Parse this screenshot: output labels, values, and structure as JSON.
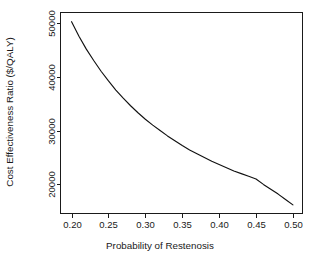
{
  "chart_data": {
    "type": "line",
    "title": "",
    "subtitle": "",
    "xlabel": "Probability of Restenosis",
    "ylabel": "Cost Effectiveness Ratio ($/QALY)",
    "xlim": [
      0.185,
      0.513
    ],
    "ylim": [
      14600,
      51900
    ],
    "grid": false,
    "legend": null,
    "annotations": [],
    "xticks": [
      0.2,
      0.25,
      0.3,
      0.35,
      0.4,
      0.45,
      0.5
    ],
    "xticklabels": [
      "0.20",
      "0.25",
      "0.30",
      "0.35",
      "0.40",
      "0.45",
      "0.50"
    ],
    "yticks": [
      20000,
      30000,
      40000,
      50000
    ],
    "yticklabels": [
      "20000",
      "30000",
      "40000",
      "50000"
    ],
    "series": [
      {
        "name": "Cost Effectiveness Ratio",
        "color": "#111111",
        "x": [
          0.2,
          0.21,
          0.22,
          0.23,
          0.24,
          0.25,
          0.26,
          0.27,
          0.28,
          0.29,
          0.3,
          0.31,
          0.32,
          0.33,
          0.34,
          0.35,
          0.36,
          0.37,
          0.38,
          0.39,
          0.4,
          0.41,
          0.42,
          0.43,
          0.44,
          0.45,
          0.46,
          0.47,
          0.48,
          0.49,
          0.5
        ],
        "values": [
          50200,
          47500,
          45100,
          43000,
          41000,
          39200,
          37500,
          36000,
          34600,
          33300,
          32100,
          31000,
          30000,
          29000,
          28100,
          27200,
          26400,
          25700,
          25000,
          24300,
          23700,
          23100,
          22500,
          22000,
          21500,
          21000,
          20000,
          19100,
          18200,
          17200,
          16200
        ]
      }
    ]
  },
  "axes": {
    "x_title": "Probability of Restenosis",
    "y_title": "Cost Effectiveness Ratio ($/QALY)"
  }
}
